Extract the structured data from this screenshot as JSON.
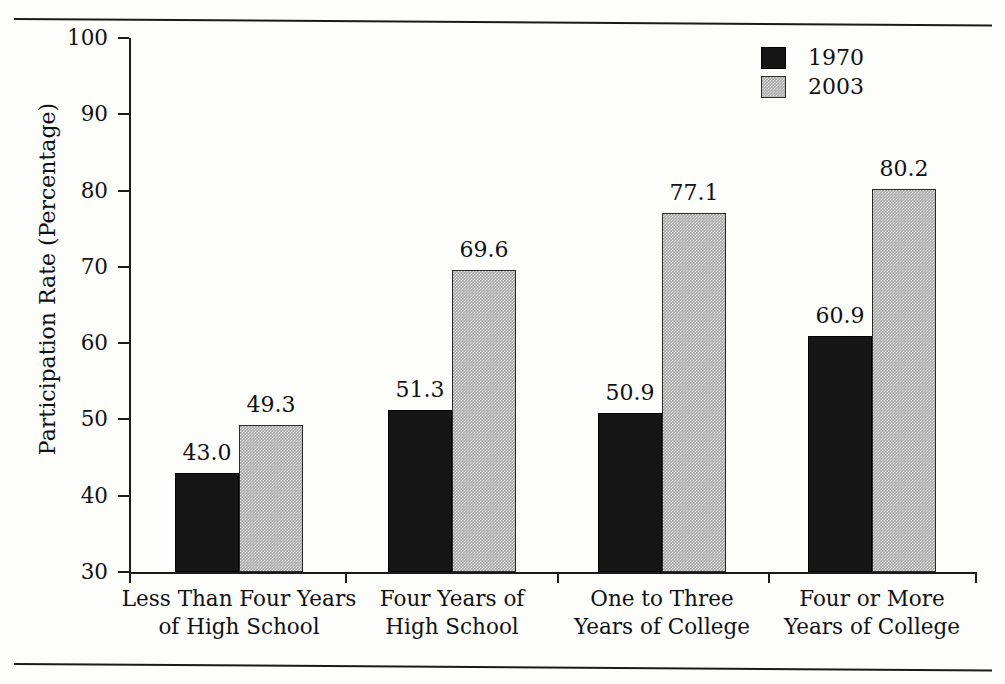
{
  "chart_data": {
    "type": "bar",
    "title": "",
    "xlabel": "",
    "ylabel": "Participation Rate (Percentage)",
    "ylim": [
      30,
      100
    ],
    "ytick_step": 10,
    "yticks": [
      "30",
      "40",
      "50",
      "60",
      "70",
      "80",
      "90",
      "100"
    ],
    "grid": false,
    "legend_position": "top-right",
    "categories": [
      "Less Than Four Years of High School",
      "Four Years of High School",
      "One to Three Years of College",
      "Four or More Years of College"
    ],
    "category_lines": [
      [
        "Less Than Four Years",
        "of High School"
      ],
      [
        "Four Years of",
        "High School"
      ],
      [
        "One to Three",
        "Years of College"
      ],
      [
        "Four or More",
        "Years of College"
      ]
    ],
    "series": [
      {
        "name": "1970",
        "color": "#151515",
        "values": [
          43.0,
          51.3,
          50.9,
          60.9
        ],
        "labels": [
          "43.0",
          "51.3",
          "50.9",
          "60.9"
        ]
      },
      {
        "name": "2003",
        "color": "#a9a9a9",
        "values": [
          49.3,
          69.6,
          77.1,
          80.2
        ],
        "labels": [
          "49.3",
          "69.6",
          "77.1",
          "80.2"
        ]
      }
    ]
  },
  "legend": {
    "entries": [
      {
        "label": "1970",
        "swatch": "black-square-swatch"
      },
      {
        "label": "2003",
        "swatch": "gray-square-swatch"
      }
    ]
  },
  "axis": {
    "y_title": "Participation Rate (Percentage)"
  },
  "colors": {
    "series_1970": "#151515",
    "series_2003": "#a9a9a9",
    "axis": "#1a1a1a",
    "text": "#111111",
    "background": "#fdfdfc"
  }
}
